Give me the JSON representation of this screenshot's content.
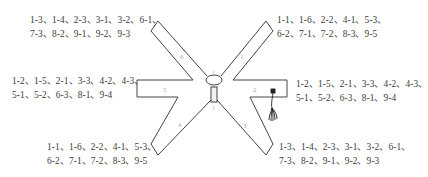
{
  "diagram": {
    "title": "",
    "arms": [
      {
        "id": "1",
        "label": "1",
        "position": "upper-right"
      },
      {
        "id": "2",
        "label": "2",
        "position": "right"
      },
      {
        "id": "3",
        "label": "3",
        "position": "lower-right"
      },
      {
        "id": "4",
        "label": "4",
        "position": "lower-left"
      },
      {
        "id": "5",
        "label": "5",
        "position": "left"
      },
      {
        "id": "6",
        "label": "6",
        "position": "upper-left"
      }
    ],
    "hub_marks": {
      "top": "!",
      "bottom": "!"
    },
    "colors": {
      "stroke": "#444444",
      "cable": "#222222",
      "text": "#3a3a3a",
      "arm_label": "#aaaaaa"
    }
  },
  "labels": {
    "upper_left": {
      "line1": "1-3、1-4、2-3、3-1、3-2、6-1、",
      "line2": "7-3、8-2、9-1、9-2、9-3"
    },
    "upper_right": {
      "line1": "1-1、1-6、2-2、4-1、5-3、",
      "line2": "6-2、7-1、7-2、8-3、9-5"
    },
    "middle_left": {
      "line1": "1-2、1-5、2-1、3-3、4-2、4-3、",
      "line2": "5-1、5-2、6-3、8-1、9-4"
    },
    "middle_right": {
      "line1": "1-2、1-5、2-1、3-3、4-2、4-3、",
      "line2": "5-1、5-2、6-3、8-1、9-4"
    },
    "lower_left": {
      "line1": "1-1、1-6、2-2、4-1、5-3、",
      "line2": "6-2、7-1、7-2、8-3、9-5"
    },
    "lower_right": {
      "line1": "1-3、1-4、2-3、3-1、3-2、6-1、",
      "line2": "7-3、8-2、9-1、9-2、9-3"
    }
  }
}
